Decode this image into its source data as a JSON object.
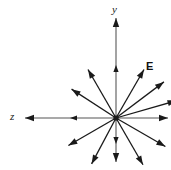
{
  "figure": {
    "background_color": "#ffffff",
    "stroke_color": "#1a1a1a",
    "axis_gray": "#8c8c8c",
    "width": 171,
    "height": 170
  },
  "labels": {
    "y_axis": "y",
    "z_axis": "z",
    "field": "E"
  },
  "chart_data": {
    "type": "scatter",
    "xlabel": "z",
    "ylabel": "y",
    "origin": {
      "x": 116,
      "y": 118
    },
    "grid": false,
    "legend": null,
    "annotations": [
      {
        "text": "y",
        "x": 112,
        "y": 4,
        "style": "italic"
      },
      {
        "text": "z",
        "x": 10,
        "y": 111,
        "style": "italic"
      },
      {
        "text": "E",
        "x": 146,
        "y": 61,
        "style": "bold"
      }
    ],
    "axis_rays": [
      {
        "name": "y-axis-up",
        "angle_deg": 90,
        "length": 100,
        "color": "#8c8c8c",
        "tip": {
          "x": 116,
          "y": 18
        },
        "mid_arrowhead_at": 53
      },
      {
        "name": "y-axis-down",
        "angle_deg": 270,
        "length": 44,
        "color": "#8c8c8c",
        "tip": {
          "x": 116,
          "y": 162
        },
        "mid_arrowhead_at": 26
      },
      {
        "name": "z-axis-left",
        "angle_deg": 180,
        "length": 91,
        "color": "#8c8c8c",
        "tip": {
          "x": 25,
          "y": 118
        },
        "mid_arrowhead_at": 46
      },
      {
        "name": "z-axis-right",
        "angle_deg": 0,
        "length": 52,
        "color": "#8c8c8c",
        "tip": {
          "x": 168,
          "y": 118
        },
        "mid_arrowhead_at": null
      }
    ],
    "field_vectors": [
      {
        "name": "vector-1",
        "angle_deg": 60,
        "length": 56
      },
      {
        "name": "vector-2",
        "angle_deg": 37,
        "length": 60
      },
      {
        "name": "vector-3",
        "angle_deg": 16,
        "length": 63
      },
      {
        "name": "vector-4",
        "angle_deg": 120,
        "length": 56
      },
      {
        "name": "vector-5",
        "angle_deg": 147,
        "length": 53
      },
      {
        "name": "vector-6",
        "angle_deg": 210,
        "length": 55
      },
      {
        "name": "vector-7",
        "angle_deg": 242,
        "length": 52
      },
      {
        "name": "vector-8",
        "angle_deg": 300,
        "length": 54
      },
      {
        "name": "vector-9",
        "angle_deg": 330,
        "length": 57
      }
    ]
  }
}
